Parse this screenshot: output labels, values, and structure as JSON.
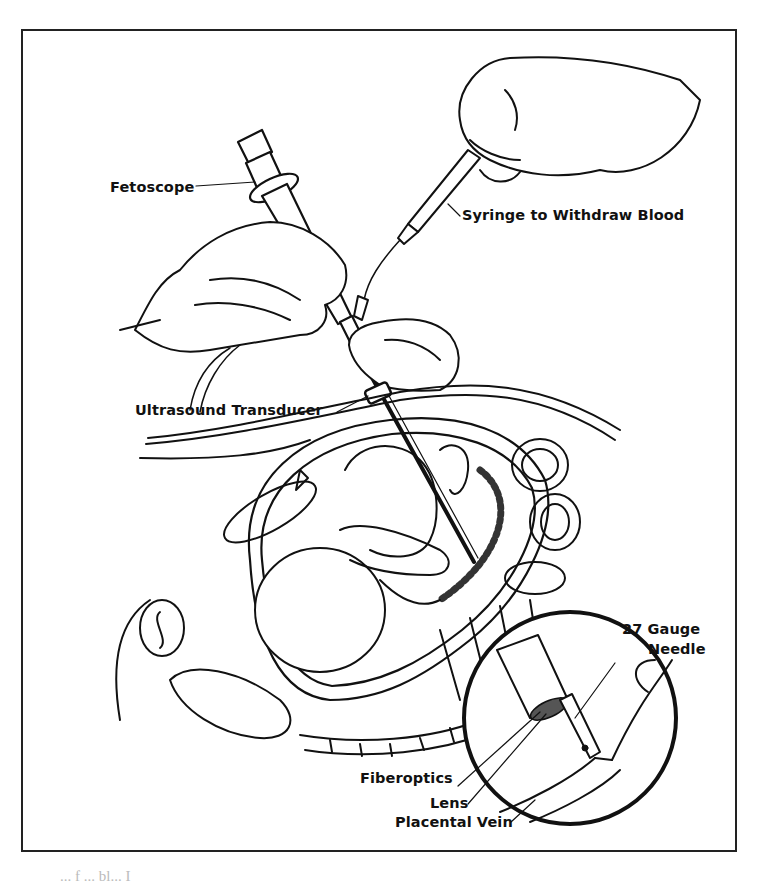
{
  "figure": {
    "labels": {
      "fetoscope": "Fetoscope",
      "syringe": "Syringe to Withdraw Blood",
      "transducer": "Ultrasound Transducer",
      "needle_line1": "27 Gauge",
      "needle_line2": "Needle",
      "fiberoptics": "Fiberoptics",
      "lens": "Lens",
      "placental_vein": "Placental Vein"
    },
    "inset": "magnified-view-of-needle-tip",
    "colors": {
      "ink": "#111111",
      "paper": "#ffffff"
    }
  },
  "caption_fragment": "... f ... bl... I"
}
